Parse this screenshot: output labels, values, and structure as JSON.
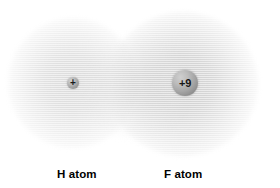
{
  "diagram": {
    "background_color": "#ffffff",
    "nuclei": [
      {
        "id": "hydrogen",
        "icon": "nucleus-plus-icon",
        "charge_label": "+",
        "charge_value": 1,
        "center_x": 73,
        "center_y": 83,
        "radius": 6,
        "fill_color": "#b9b9b9"
      },
      {
        "id": "fluorine",
        "icon": "nucleus-sphere-icon",
        "charge_label": "+9",
        "charge_value": 9,
        "center_x": 185,
        "center_y": 83,
        "radius": 13,
        "fill_color": "#a5a5a5"
      }
    ],
    "clouds": [
      {
        "id": "hydrogen-cloud",
        "center_x": 73,
        "center_y": 83,
        "radius": 65,
        "tint": "#c4c4c4",
        "peak_opacity": 0.62
      },
      {
        "id": "fluorine-cloud",
        "center_x": 183,
        "center_y": 84,
        "radius": 75,
        "tint": "#bcbcbc",
        "peak_opacity": 0.72
      }
    ],
    "captions": {
      "hydrogen": "H atom",
      "fluorine": "F atom"
    }
  }
}
